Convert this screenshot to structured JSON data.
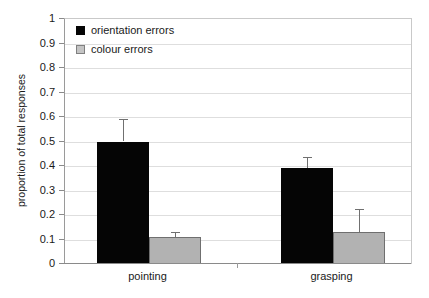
{
  "chart_data": {
    "type": "bar",
    "title": "",
    "xlabel": "",
    "ylabel": "proportion of total responses",
    "categories": [
      "pointing",
      "grasping"
    ],
    "ylim": [
      0,
      1
    ],
    "ytick_labels": [
      "1",
      "0.9",
      "0.8",
      "0.7",
      "0.6",
      "0.5",
      "0.4",
      "0.3",
      "0.2",
      "0.1",
      "0"
    ],
    "ytick_values": [
      1,
      0.9,
      0.8,
      0.7,
      0.6,
      0.5,
      0.4,
      0.3,
      0.2,
      0.1,
      0
    ],
    "grid": true,
    "legend_position": "top-left",
    "series": [
      {
        "name": "orientation errors",
        "color": "#050505",
        "values": [
          0.5,
          0.39
        ],
        "errors_upper": [
          0.59,
          0.435
        ],
        "errors_lower": [
          0.5,
          0.39
        ]
      },
      {
        "name": "colour errors",
        "color": "#b2b2b2",
        "values": [
          0.11,
          0.13
        ],
        "errors_upper": [
          0.13,
          0.225
        ],
        "errors_lower": [
          0.11,
          0.13
        ]
      }
    ]
  },
  "legend": {
    "items": [
      {
        "label": "orientation errors",
        "swatch": "black-square-icon"
      },
      {
        "label": "colour errors",
        "swatch": "grey-square-icon"
      }
    ]
  },
  "axes": {
    "y_title": "proportion of total responses",
    "x_categories": [
      "pointing",
      "grasping"
    ]
  }
}
